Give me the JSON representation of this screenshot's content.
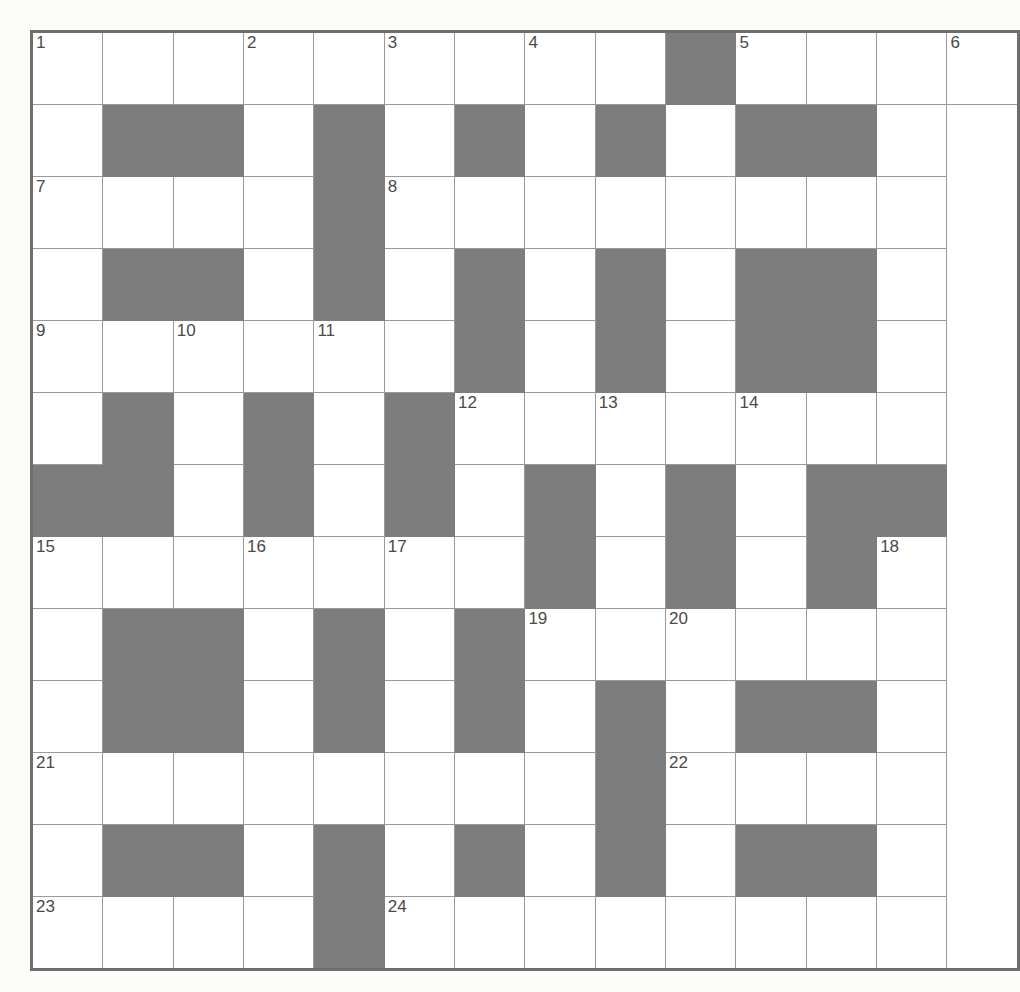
{
  "puzzle": {
    "title": "Crossword Grid",
    "rows": 13,
    "columns": 13,
    "colors": {
      "block_fill": "#7d7d7d",
      "cell_fill": "#ffffff",
      "grid_line": "#9a9a9a",
      "outer_border": "#6e6e6e",
      "number_text": "#4a4a4a",
      "page_background": "#fcfcfb"
    },
    "cell_size_px": 73,
    "max_clue_number": 24,
    "grid": [
      [
        "1",
        "",
        "",
        "2",
        "",
        "3",
        "",
        "4",
        "",
        "#",
        "5",
        "",
        "",
        "6"
      ],
      [
        "",
        "#",
        "#",
        "",
        "#",
        "",
        "#",
        "",
        "#",
        "",
        "#",
        "#",
        ""
      ],
      [
        "7",
        "",
        "",
        "",
        "#",
        "8",
        "",
        "",
        "",
        "",
        "",
        "",
        ""
      ],
      [
        "",
        "#",
        "#",
        "",
        "#",
        "",
        "#",
        "",
        "#",
        "",
        "#",
        "#",
        ""
      ],
      [
        "9",
        "",
        "10",
        "",
        "11",
        "",
        "#",
        "",
        "#",
        "",
        "#",
        "#",
        ""
      ],
      [
        "",
        "#",
        "",
        "#",
        "",
        "#",
        "12",
        "",
        "13",
        "",
        "14",
        "",
        ""
      ],
      [
        "#",
        "#",
        "",
        "#",
        "",
        "#",
        "",
        "#",
        "",
        "#",
        "",
        "#",
        "#"
      ],
      [
        "15",
        "",
        "",
        "16",
        "",
        "17",
        "",
        "#",
        "",
        "#",
        "",
        "#",
        "18"
      ],
      [
        "",
        "#",
        "#",
        "",
        "#",
        "",
        "#",
        "19",
        "",
        "20",
        "",
        "",
        ""
      ],
      [
        "",
        "#",
        "#",
        "",
        "#",
        "",
        "#",
        "",
        "#",
        "",
        "#",
        "#",
        ""
      ],
      [
        "21",
        "",
        "",
        "",
        "",
        "",
        "",
        "",
        "#",
        "22",
        "",
        "",
        ""
      ],
      [
        "",
        "#",
        "#",
        "",
        "#",
        "",
        "#",
        "",
        "#",
        "",
        "#",
        "#",
        ""
      ],
      [
        "23",
        "",
        "",
        "",
        "#",
        "24",
        "",
        "",
        "",
        "",
        "",
        "",
        ""
      ]
    ]
  }
}
